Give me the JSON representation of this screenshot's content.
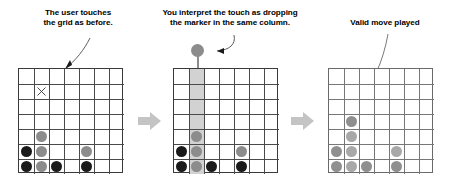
{
  "figure": {
    "type": "three-panel-instructional-diagram",
    "panel_count": 3,
    "separator_icon": "right-arrow-icon"
  },
  "captions": {
    "panel1": "The user touches\nthe grid as before.",
    "panel2": "You interpret the touch as dropping\nthe marker in the same column.",
    "panel3": "Valid move played"
  },
  "board": {
    "columns": 7,
    "rows": 7,
    "cell_px": 15
  },
  "colors": {
    "black_disc": "#1a1a1a",
    "gray_disc": "#8c8c8c",
    "grid_line": "#4a4a4a",
    "grid_border": "#3a3a3a",
    "column_highlight": "#d2d2d2",
    "separator_arrow": "#bfbfbf",
    "faded_black_disc": "#8f8f8f",
    "faded_gray_disc": "#a8a8a8",
    "text": "#000000"
  },
  "panels": [
    {
      "id": "panel-1",
      "name": "user-touches-grid",
      "faded": false,
      "highlight_column": null,
      "touch_marker": {
        "row": 1,
        "col": 1,
        "glyph": "x-mark"
      },
      "pointer_arrow": {
        "target_row": 0,
        "target_col": 2,
        "label": "annotation-arrow"
      },
      "discs": [
        {
          "row": 4,
          "col": 1,
          "color": "gray"
        },
        {
          "row": 5,
          "col": 0,
          "color": "black"
        },
        {
          "row": 5,
          "col": 1,
          "color": "gray"
        },
        {
          "row": 5,
          "col": 4,
          "color": "gray"
        },
        {
          "row": 6,
          "col": 0,
          "color": "black"
        },
        {
          "row": 6,
          "col": 1,
          "color": "gray"
        },
        {
          "row": 6,
          "col": 2,
          "color": "black"
        },
        {
          "row": 6,
          "col": 4,
          "color": "black"
        }
      ]
    },
    {
      "id": "panel-2",
      "name": "interpret-touch-as-column-drop",
      "faded": false,
      "highlight_column": 1,
      "touch_marker": null,
      "floating_marker": {
        "col": 1,
        "color": "gray",
        "shape": "pin-marker"
      },
      "pointer_arrow": {
        "target": "floating-marker",
        "label": "annotation-arrow"
      },
      "discs": [
        {
          "row": 4,
          "col": 1,
          "color": "gray"
        },
        {
          "row": 5,
          "col": 0,
          "color": "black"
        },
        {
          "row": 5,
          "col": 1,
          "color": "gray"
        },
        {
          "row": 5,
          "col": 4,
          "color": "gray"
        },
        {
          "row": 6,
          "col": 0,
          "color": "black"
        },
        {
          "row": 6,
          "col": 1,
          "color": "gray"
        },
        {
          "row": 6,
          "col": 2,
          "color": "black"
        },
        {
          "row": 6,
          "col": 4,
          "color": "black"
        }
      ]
    },
    {
      "id": "panel-3",
      "name": "valid-move-played",
      "faded": true,
      "highlight_column": null,
      "touch_marker": null,
      "pointer_arrow": {
        "target_row": 3,
        "target_col": 1,
        "label": "annotation-arrow"
      },
      "new_disc": {
        "row": 3,
        "col": 1,
        "color": "gray"
      },
      "discs": [
        {
          "row": 3,
          "col": 1,
          "color": "black"
        },
        {
          "row": 4,
          "col": 1,
          "color": "gray"
        },
        {
          "row": 5,
          "col": 0,
          "color": "black"
        },
        {
          "row": 5,
          "col": 1,
          "color": "gray"
        },
        {
          "row": 5,
          "col": 4,
          "color": "gray"
        },
        {
          "row": 6,
          "col": 0,
          "color": "black"
        },
        {
          "row": 6,
          "col": 1,
          "color": "gray"
        },
        {
          "row": 6,
          "col": 2,
          "color": "black"
        },
        {
          "row": 6,
          "col": 4,
          "color": "black"
        }
      ]
    }
  ]
}
